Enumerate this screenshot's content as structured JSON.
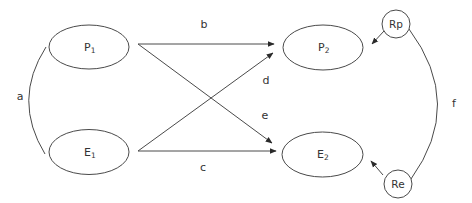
{
  "diagram": {
    "type": "cross-lagged path diagram",
    "nodes": [
      {
        "id": "P1",
        "base": "P",
        "sub": "1",
        "shape": "ellipse",
        "cx": 89,
        "cy": 47
      },
      {
        "id": "E1",
        "base": "E",
        "sub": "1",
        "shape": "ellipse",
        "cx": 89,
        "cy": 152
      },
      {
        "id": "P2",
        "base": "P",
        "sub": "2",
        "shape": "ellipse",
        "cx": 323,
        "cy": 47
      },
      {
        "id": "E2",
        "base": "E",
        "sub": "2",
        "shape": "ellipse",
        "cx": 322,
        "cy": 154
      },
      {
        "id": "Rp",
        "label": "Rp",
        "shape": "circle",
        "cx": 396,
        "cy": 24
      },
      {
        "id": "Re",
        "label": "Re",
        "shape": "circle",
        "cx": 398,
        "cy": 184
      }
    ],
    "paths": [
      {
        "label": "a",
        "from": "P1",
        "to": "E1",
        "kind": "correlation-curve"
      },
      {
        "label": "b",
        "from": "P1",
        "to": "P2",
        "kind": "arrow"
      },
      {
        "label": "c",
        "from": "E1",
        "to": "E2",
        "kind": "arrow"
      },
      {
        "label": "d",
        "from": "E1",
        "to": "P2",
        "kind": "arrow"
      },
      {
        "label": "e",
        "from": "P1",
        "to": "E2",
        "kind": "arrow"
      },
      {
        "label": "f",
        "from": "Rp",
        "to": "Re",
        "kind": "correlation-curve"
      },
      {
        "label": "",
        "from": "Rp",
        "to": "P2",
        "kind": "residual-arrow"
      },
      {
        "label": "",
        "from": "Re",
        "to": "E2",
        "kind": "residual-arrow"
      }
    ],
    "labels": {
      "p1_base": "P",
      "p1_sub": "1",
      "e1_base": "E",
      "e1_sub": "1",
      "p2_base": "P",
      "p2_sub": "2",
      "e2_base": "E",
      "e2_sub": "2",
      "rp": "Rp",
      "re": "Re",
      "a": "a",
      "b": "b",
      "c": "c",
      "d": "d",
      "e": "e",
      "f": "f"
    },
    "colors": {
      "stroke": "#4a4a4a",
      "text": "#333333",
      "background": "#ffffff"
    }
  }
}
